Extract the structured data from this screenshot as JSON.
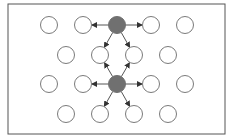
{
  "diagram": {
    "frame": {
      "x": 8,
      "y": 4,
      "width": 217,
      "height": 130,
      "stroke": "#555555"
    },
    "style": {
      "node_radius": 8.5,
      "node_stroke": "#7a7a7a",
      "node_fill": "#ffffff",
      "active_fill": "#707070",
      "edge_color": "#555555"
    },
    "nodes": [
      {
        "id": "r1c1",
        "x": 49,
        "y": 25,
        "active": false
      },
      {
        "id": "r1c2",
        "x": 83,
        "y": 25,
        "active": false
      },
      {
        "id": "r1c3",
        "x": 117,
        "y": 25,
        "active": true
      },
      {
        "id": "r1c4",
        "x": 151,
        "y": 25,
        "active": false
      },
      {
        "id": "r1c5",
        "x": 185,
        "y": 25,
        "active": false
      },
      {
        "id": "r2c1",
        "x": 66,
        "y": 55,
        "active": false
      },
      {
        "id": "r2c2",
        "x": 100,
        "y": 55,
        "active": false
      },
      {
        "id": "r2c3",
        "x": 134,
        "y": 55,
        "active": false
      },
      {
        "id": "r2c4",
        "x": 168,
        "y": 55,
        "active": false
      },
      {
        "id": "r3c1",
        "x": 49,
        "y": 84,
        "active": false
      },
      {
        "id": "r3c2",
        "x": 83,
        "y": 84,
        "active": false
      },
      {
        "id": "r3c3",
        "x": 117,
        "y": 84,
        "active": true
      },
      {
        "id": "r3c4",
        "x": 151,
        "y": 84,
        "active": false
      },
      {
        "id": "r3c5",
        "x": 185,
        "y": 84,
        "active": false
      },
      {
        "id": "r4c1",
        "x": 66,
        "y": 114,
        "active": false
      },
      {
        "id": "r4c2",
        "x": 100,
        "y": 114,
        "active": false
      },
      {
        "id": "r4c3",
        "x": 134,
        "y": 114,
        "active": false
      },
      {
        "id": "r4c4",
        "x": 168,
        "y": 114,
        "active": false
      }
    ],
    "edges": [
      {
        "from": "r1c3",
        "to": "r1c2"
      },
      {
        "from": "r1c3",
        "to": "r1c4"
      },
      {
        "from": "r1c3",
        "to": "r2c2"
      },
      {
        "from": "r1c3",
        "to": "r2c3"
      },
      {
        "from": "r3c3",
        "to": "r2c2"
      },
      {
        "from": "r3c3",
        "to": "r2c3"
      },
      {
        "from": "r3c3",
        "to": "r3c2"
      },
      {
        "from": "r3c3",
        "to": "r3c4"
      },
      {
        "from": "r3c3",
        "to": "r4c2"
      },
      {
        "from": "r3c3",
        "to": "r4c3"
      }
    ]
  }
}
